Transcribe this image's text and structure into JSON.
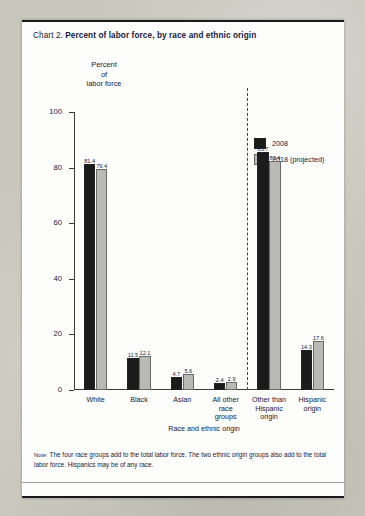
{
  "title": {
    "number": "Chart 2.",
    "text": "Percent of labor force, by race and ethnic origin"
  },
  "note": {
    "tag": "Note:",
    "text": "The four race groups add to the total labor force. The two ethnic origin groups also add to the total labor force. Hispanics may be of any race."
  },
  "legend": {
    "position": "top-right",
    "items": [
      {
        "label": "2008",
        "color": "#1b1b1b"
      },
      {
        "label": "2018 (projected)",
        "color": "#b9b9b6"
      }
    ]
  },
  "chart_data": {
    "type": "bar",
    "title": "Percent of labor force, by race and ethnic origin",
    "xlabel": "Race and ethnic origin",
    "ylabel": "Percent of labor force",
    "ylim": [
      0,
      100
    ],
    "yticks": [
      "0",
      "20",
      "40",
      "60",
      "80",
      "100"
    ],
    "grid": false,
    "legend_position": "top-right",
    "categories": [
      "White",
      "Black",
      "Asian",
      "All other race groups",
      "Other than Hispanic origin",
      "Hispanic origin"
    ],
    "category_lines": [
      [
        "White"
      ],
      [
        "Black"
      ],
      [
        "Asian"
      ],
      [
        "All other",
        "race",
        "groups"
      ],
      [
        "Other than",
        "Hispanic",
        "origin"
      ],
      [
        "Hispanic",
        "origin"
      ]
    ],
    "series": [
      {
        "name": "2008",
        "color": "#1b1b1b",
        "values": [
          81.4,
          11.5,
          4.7,
          2.4,
          85.7,
          14.3
        ]
      },
      {
        "name": "2018 (projected)",
        "color": "#b9b9b6",
        "values": [
          79.4,
          12.1,
          5.6,
          2.9,
          82.4,
          17.6
        ]
      }
    ],
    "annotations": [
      {
        "type": "dashed-divider",
        "after_category_index": 3,
        "note": "separates race groups from ethnic origin groups"
      }
    ]
  }
}
